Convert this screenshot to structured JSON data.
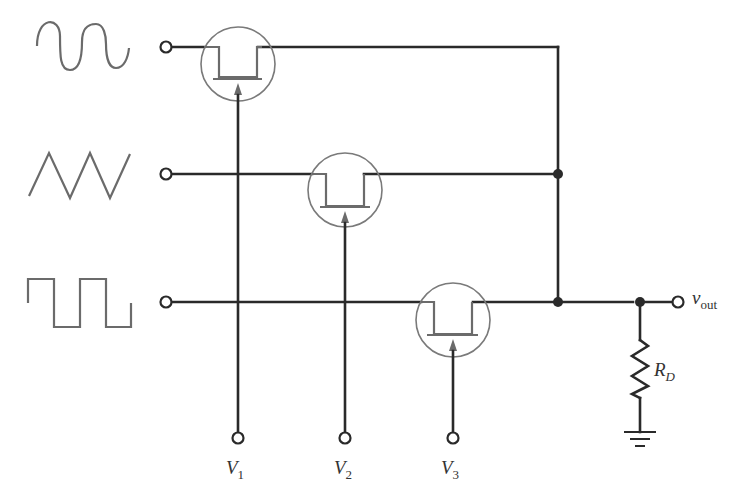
{
  "diagram": {
    "type": "analog multiplexer circuit",
    "colors": {
      "wire": "#2a2a2a",
      "symbol": "#6b6b6b",
      "background": "#ffffff"
    },
    "inputs": [
      {
        "name": "sine",
        "waveform": "sine-wave"
      },
      {
        "name": "triangle",
        "waveform": "triangle-wave"
      },
      {
        "name": "square",
        "waveform": "square-wave"
      }
    ],
    "switches": [
      {
        "id": "M1",
        "control": "V1"
      },
      {
        "id": "M2",
        "control": "V2"
      },
      {
        "id": "M3",
        "control": "V3"
      }
    ],
    "labels": {
      "v1": {
        "main": "V",
        "sub": "1"
      },
      "v2": {
        "main": "V",
        "sub": "2"
      },
      "v3": {
        "main": "V",
        "sub": "3"
      },
      "vout": {
        "main": "v",
        "sub": "out"
      },
      "rd": {
        "main": "R",
        "sub": "D"
      }
    },
    "output_load": "resistor R_D to ground"
  }
}
